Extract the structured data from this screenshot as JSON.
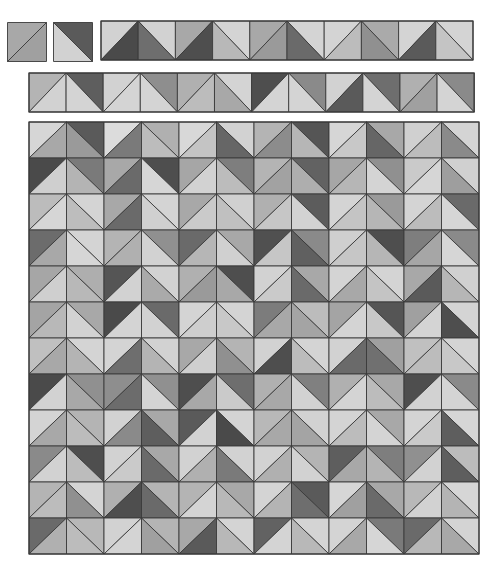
{
  "line_color": "#3a3a3a",
  "legend": {
    "split_slash": "/ : diagonal bottom-left to top-right; A = top-left triangle, B = bottom-right triangle",
    "split_backslash": "\\ : diagonal top-left to bottom-right; A = top-right triangle, B = bottom-left triangle"
  },
  "singles": [
    {
      "x": 7,
      "y": 22,
      "size": 39,
      "split": "/",
      "a": "#a8a8a8",
      "b": "#a0a0a0"
    },
    {
      "x": 53,
      "y": 22,
      "size": 39,
      "split": "\\",
      "a": "#5a5a5a",
      "b": "#d2d2d2"
    }
  ],
  "strip1": {
    "x": 100,
    "y": 20,
    "cell_w": 37.2,
    "cell_h": 39,
    "cells": [
      {
        "split": "/",
        "a": "#d2d2d2",
        "b": "#4a4a4a"
      },
      {
        "split": "\\",
        "a": "#d2d2d2",
        "b": "#6e6e6e"
      },
      {
        "split": "/",
        "a": "#a8a8a8",
        "b": "#4e4e4e"
      },
      {
        "split": "\\",
        "a": "#d4d4d4",
        "b": "#b8b8b8"
      },
      {
        "split": "/",
        "a": "#a8a8a8",
        "b": "#9a9a9a"
      },
      {
        "split": "\\",
        "a": "#d4d4d4",
        "b": "#6a6a6a"
      },
      {
        "split": "/",
        "a": "#d4d4d4",
        "b": "#bcbcbc"
      },
      {
        "split": "\\",
        "a": "#aaaaaa",
        "b": "#909090"
      },
      {
        "split": "/",
        "a": "#d4d4d4",
        "b": "#5a5a5a"
      },
      {
        "split": "\\",
        "a": "#d4d4d4",
        "b": "#c4c4c4"
      }
    ]
  },
  "strip2": {
    "x": 28,
    "y": 72,
    "cell_w": 37.1,
    "cell_h": 39,
    "cells": [
      {
        "split": "/",
        "a": "#b4b4b4",
        "b": "#d2d2d2"
      },
      {
        "split": "\\",
        "a": "#5e5e5e",
        "b": "#d4d4d4"
      },
      {
        "split": "/",
        "a": "#d2d2d2",
        "b": "#d4d4d4"
      },
      {
        "split": "\\",
        "a": "#8e8e8e",
        "b": "#d4d4d4"
      },
      {
        "split": "/",
        "a": "#b0b0b0",
        "b": "#bcbcbc"
      },
      {
        "split": "\\",
        "a": "#d4d4d4",
        "b": "#a8a8a8"
      },
      {
        "split": "/",
        "a": "#4e4e4e",
        "b": "#d4d4d4"
      },
      {
        "split": "\\",
        "a": "#8a8a8a",
        "b": "#d4d4d4"
      },
      {
        "split": "/",
        "a": "#d2d2d2",
        "b": "#5a5a5a"
      },
      {
        "split": "\\",
        "a": "#6e6e6e",
        "b": "#d4d4d4"
      },
      {
        "split": "/",
        "a": "#b0b0b0",
        "b": "#a0a0a0"
      },
      {
        "split": "\\",
        "a": "#8a8a8a",
        "b": "#d4d4d4"
      }
    ]
  },
  "main_grid": {
    "x": 28,
    "y": 121,
    "cell_w": 37.5,
    "cell_h": 36,
    "cols": 12,
    "rows": 12,
    "split_rule": "even columns '/', odd columns '\\'",
    "rows_data": [
      [
        [
          "#d6d6d6",
          "#a8a8a8"
        ],
        [
          "#5a5a5a",
          "#9a9a9a"
        ],
        [
          "#dcdcdc",
          "#7a7a7a"
        ],
        [
          "#b0b0b0",
          "#bcbcbc"
        ],
        [
          "#d8d8d8",
          "#c4c4c4"
        ],
        [
          "#d2d2d2",
          "#666666"
        ],
        [
          "#b4b4b4",
          "#8c8c8c"
        ],
        [
          "#555555",
          "#b6b6b6"
        ],
        [
          "#d6d6d6",
          "#c8c8c8"
        ],
        [
          "#a8a8a8",
          "#666666"
        ],
        [
          "#d0d0d0",
          "#bcbcbc"
        ],
        [
          "#d4d4d4",
          "#8a8a8a"
        ]
      ],
      [
        [
          "#4a4a4a",
          "#cfcfcf"
        ],
        [
          "#7a7a7a",
          "#b4b4b4"
        ],
        [
          "#a8a8a8",
          "#6a6a6a"
        ],
        [
          "#4e4e4e",
          "#d6d6d6"
        ],
        [
          "#a6a6a6",
          "#d2d2d2"
        ],
        [
          "#7e7e7e",
          "#bcbcbc"
        ],
        [
          "#b4b4b4",
          "#a2a2a2"
        ],
        [
          "#626262",
          "#aeaeae"
        ],
        [
          "#a6a6a6",
          "#b6b6b6"
        ],
        [
          "#909090",
          "#d4d4d4"
        ],
        [
          "#cacaca",
          "#d6d6d6"
        ],
        [
          "#d0d0d0",
          "#9e9e9e"
        ]
      ],
      [
        [
          "#bcbcbc",
          "#d6d6d6"
        ],
        [
          "#d4d4d4",
          "#bdbdbd"
        ],
        [
          "#a8a8a8",
          "#6a6a6a"
        ],
        [
          "#d4d4d4",
          "#d0d0d0"
        ],
        [
          "#a8a8a8",
          "#cacaca"
        ],
        [
          "#d0d0d0",
          "#c0c0c0"
        ],
        [
          "#b0b0b0",
          "#c6c6c6"
        ],
        [
          "#5c5c5c",
          "#d2d2d2"
        ],
        [
          "#d4d4d4",
          "#c4c4c4"
        ],
        [
          "#9a9a9a",
          "#b6b6b6"
        ],
        [
          "#d4d4d4",
          "#bcbcbc"
        ],
        [
          "#6a6a6a",
          "#d6d6d6"
        ]
      ],
      [
        [
          "#6c6c6c",
          "#a8a8a8"
        ],
        [
          "#d4d4d4",
          "#d6d6d6"
        ],
        [
          "#b4b4b4",
          "#b0b0b0"
        ],
        [
          "#909090",
          "#d2d2d2"
        ],
        [
          "#6a6a6a",
          "#b6b6b6"
        ],
        [
          "#a8a8a8",
          "#d0d0d0"
        ],
        [
          "#505050",
          "#c6c6c6"
        ],
        [
          "#8a8a8a",
          "#606060"
        ],
        [
          "#cfcfcf",
          "#c6c6c6"
        ],
        [
          "#4e4e4e",
          "#b6b6b6"
        ],
        [
          "#7e7e7e",
          "#a6a6a6"
        ],
        [
          "#8a8a8a",
          "#d6d6d6"
        ]
      ],
      [
        [
          "#a6a6a6",
          "#cfcfcf"
        ],
        [
          "#aeaeae",
          "#b8b8b8"
        ],
        [
          "#555555",
          "#d2d2d2"
        ],
        [
          "#d2d2d2",
          "#aaaaaa"
        ],
        [
          "#b0b0b0",
          "#9a9a9a"
        ],
        [
          "#4e4e4e",
          "#a8a8a8"
        ],
        [
          "#d2d2d2",
          "#cacaca"
        ],
        [
          "#a8a8a8",
          "#6a6a6a"
        ],
        [
          "#d4d4d4",
          "#a8a8a8"
        ],
        [
          "#d4d4d4",
          "#c4c4c4"
        ],
        [
          "#a8a8a8",
          "#5a5a5a"
        ],
        [
          "#d0d0d0",
          "#b6b6b6"
        ]
      ],
      [
        [
          "#a4a4a4",
          "#b8b8b8"
        ],
        [
          "#a8a8a8",
          "#d2d2d2"
        ],
        [
          "#4a4a4a",
          "#d4d4d4"
        ],
        [
          "#6a6a6a",
          "#d2d2d2"
        ],
        [
          "#d4d4d4",
          "#cecece"
        ],
        [
          "#d4d4d4",
          "#c8c8c8"
        ],
        [
          "#7c7c7c",
          "#a8a8a8"
        ],
        [
          "#bcbcbc",
          "#a4a4a4"
        ],
        [
          "#a4a4a4",
          "#d4d4d4"
        ],
        [
          "#555555",
          "#c8c8c8"
        ],
        [
          "#a0a0a0",
          "#d4d4d4"
        ],
        [
          "#d4d4d4",
          "#4e4e4e"
        ]
      ],
      [
        [
          "#c0c0c0",
          "#a8a8a8"
        ],
        [
          "#d4d4d4",
          "#b4b4b4"
        ],
        [
          "#d4d4d4",
          "#6e6e6e"
        ],
        [
          "#d2d2d2",
          "#b4b4b4"
        ],
        [
          "#a8a8a8",
          "#cfcfcf"
        ],
        [
          "#b4b4b4",
          "#909090"
        ],
        [
          "#d2d2d2",
          "#4e4e4e"
        ],
        [
          "#d4d4d4",
          "#bcbcbc"
        ],
        [
          "#d2d2d2",
          "#6a6a6a"
        ],
        [
          "#a0a0a0",
          "#707070"
        ],
        [
          "#c0c0c0",
          "#bcbcbc"
        ],
        [
          "#d4d4d4",
          "#c8c8c8"
        ]
      ],
      [
        [
          "#4a4a4a",
          "#d2d2d2"
        ],
        [
          "#909090",
          "#a8a8a8"
        ],
        [
          "#8e8e8e",
          "#6c6c6c"
        ],
        [
          "#909090",
          "#d4d4d4"
        ],
        [
          "#4e4e4e",
          "#a8a8a8"
        ],
        [
          "#6e6e6e",
          "#cacaca"
        ],
        [
          "#b0b0b0",
          "#a8a8a8"
        ],
        [
          "#808080",
          "#d2d2d2"
        ],
        [
          "#b0b0b0",
          "#d4d4d4"
        ],
        [
          "#a8a8a8",
          "#bcbcbc"
        ],
        [
          "#4e4e4e",
          "#d2d2d2"
        ],
        [
          "#8a8a8a",
          "#d4d4d4"
        ]
      ],
      [
        [
          "#d4d4d4",
          "#a8a8a8"
        ],
        [
          "#b4b4b4",
          "#bcbcbc"
        ],
        [
          "#d2d2d2",
          "#8a8a8a"
        ],
        [
          "#a8a8a8",
          "#5e5e5e"
        ],
        [
          "#5a5a5a",
          "#d2d2d2"
        ],
        [
          "#d4d4d4",
          "#4a4a4a"
        ],
        [
          "#b8b8b8",
          "#a8a8a8"
        ],
        [
          "#d2d2d2",
          "#a4a4a4"
        ],
        [
          "#d4d4d4",
          "#bcbcbc"
        ],
        [
          "#a8a8a8",
          "#d4d4d4"
        ],
        [
          "#d4d4d4",
          "#cacaca"
        ],
        [
          "#d6d6d6",
          "#5e5e5e"
        ]
      ],
      [
        [
          "#8a8a8a",
          "#d2d2d2"
        ],
        [
          "#4e4e4e",
          "#bcbcbc"
        ],
        [
          "#d2d2d2",
          "#cacaca"
        ],
        [
          "#a8a8a8",
          "#6a6a6a"
        ],
        [
          "#d2d2d2",
          "#b0b0b0"
        ],
        [
          "#d2d2d2",
          "#7a7a7a"
        ],
        [
          "#d2d2d2",
          "#b0b0b0"
        ],
        [
          "#b4b4b4",
          "#d2d2d2"
        ],
        [
          "#5e5e5e",
          "#a8a8a8"
        ],
        [
          "#7e7e7e",
          "#b4b4b4"
        ],
        [
          "#909090",
          "#d2d2d2"
        ],
        [
          "#bcbcbc",
          "#5e5e5e"
        ]
      ],
      [
        [
          "#b4b4b4",
          "#bcbcbc"
        ],
        [
          "#d4d4d4",
          "#909090"
        ],
        [
          "#b0b0b0",
          "#4e4e4e"
        ],
        [
          "#b4b4b4",
          "#6a6a6a"
        ],
        [
          "#b4b4b4",
          "#d4d4d4"
        ],
        [
          "#a8a8a8",
          "#b8b8b8"
        ],
        [
          "#d4d4d4",
          "#b4b4b4"
        ],
        [
          "#5a5a5a",
          "#6e6e6e"
        ],
        [
          "#d6d6d6",
          "#a0a0a0"
        ],
        [
          "#a8a8a8",
          "#6a6a6a"
        ],
        [
          "#b8b8b8",
          "#d2d2d2"
        ],
        [
          "#d6d6d6",
          "#b4b4b4"
        ]
      ],
      [
        [
          "#6a6a6a",
          "#b0b0b0"
        ],
        [
          "#b8b8b8",
          "#bcbcbc"
        ],
        [
          "#d2d2d2",
          "#d4d4d4"
        ],
        [
          "#b4b4b4",
          "#a0a0a0"
        ],
        [
          "#a8a8a8",
          "#5a5a5a"
        ],
        [
          "#d4d4d4",
          "#b8b8b8"
        ],
        [
          "#626262",
          "#d4d4d4"
        ],
        [
          "#d4d4d4",
          "#b8b8b8"
        ],
        [
          "#d4d4d4",
          "#a8a8a8"
        ],
        [
          "#7a7a7a",
          "#d6d6d6"
        ],
        [
          "#6a6a6a",
          "#b8b8b8"
        ],
        [
          "#d4d4d4",
          "#a8a8a8"
        ]
      ]
    ]
  }
}
